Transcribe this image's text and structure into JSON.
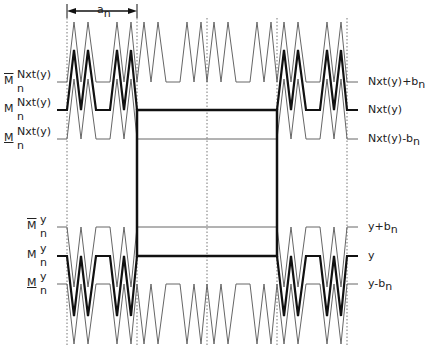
{
  "diagram": {
    "title": "",
    "width_marker": {
      "label": "a",
      "subscript": "n"
    },
    "left_labels": [
      {
        "id": "mbar-nxt",
        "decoration": "overline",
        "base": "M",
        "sup": "Nxt(y)",
        "sub": "n"
      },
      {
        "id": "m-nxt",
        "decoration": "none",
        "base": "M",
        "sup": "Nxt(y)",
        "sub": "n"
      },
      {
        "id": "munder-nxt",
        "decoration": "underline",
        "base": "M",
        "sup": "Nxt(y)",
        "sub": "n"
      },
      {
        "id": "mbar-y",
        "decoration": "overline",
        "base": "M",
        "sup": "y",
        "sub": "n"
      },
      {
        "id": "m-y",
        "decoration": "none",
        "base": "M",
        "sup": "y",
        "sub": "n"
      },
      {
        "id": "munder-y",
        "decoration": "underline",
        "base": "M",
        "sup": "y",
        "sub": "n"
      }
    ],
    "right_labels": [
      {
        "id": "nxt-plus-b",
        "text": "Nxt(y)+b",
        "sub": "n"
      },
      {
        "id": "nxt",
        "text": "Nxt(y)",
        "sub": ""
      },
      {
        "id": "nxt-minus-b",
        "text": "Nxt(y)-b",
        "sub": "n"
      },
      {
        "id": "y-plus-b",
        "text": "y+b",
        "sub": "n"
      },
      {
        "id": "y",
        "text": "y",
        "sub": ""
      },
      {
        "id": "y-minus-b",
        "text": "y-b",
        "sub": "n"
      }
    ],
    "levels_px": {
      "nxt_plus_b": 82,
      "nxt": 110,
      "nxt_minus_b": 139,
      "y_plus_b": 227,
      "y": 256,
      "y_minus_b": 284
    },
    "dotted_verticals_x": [
      67,
      137,
      207,
      277,
      347
    ],
    "central_box": {
      "x1": 137,
      "y1": 110,
      "x2": 277,
      "y2": 256
    },
    "colors": {
      "thick": "#111111",
      "thin": "#666666",
      "dotted": "#777777"
    }
  }
}
